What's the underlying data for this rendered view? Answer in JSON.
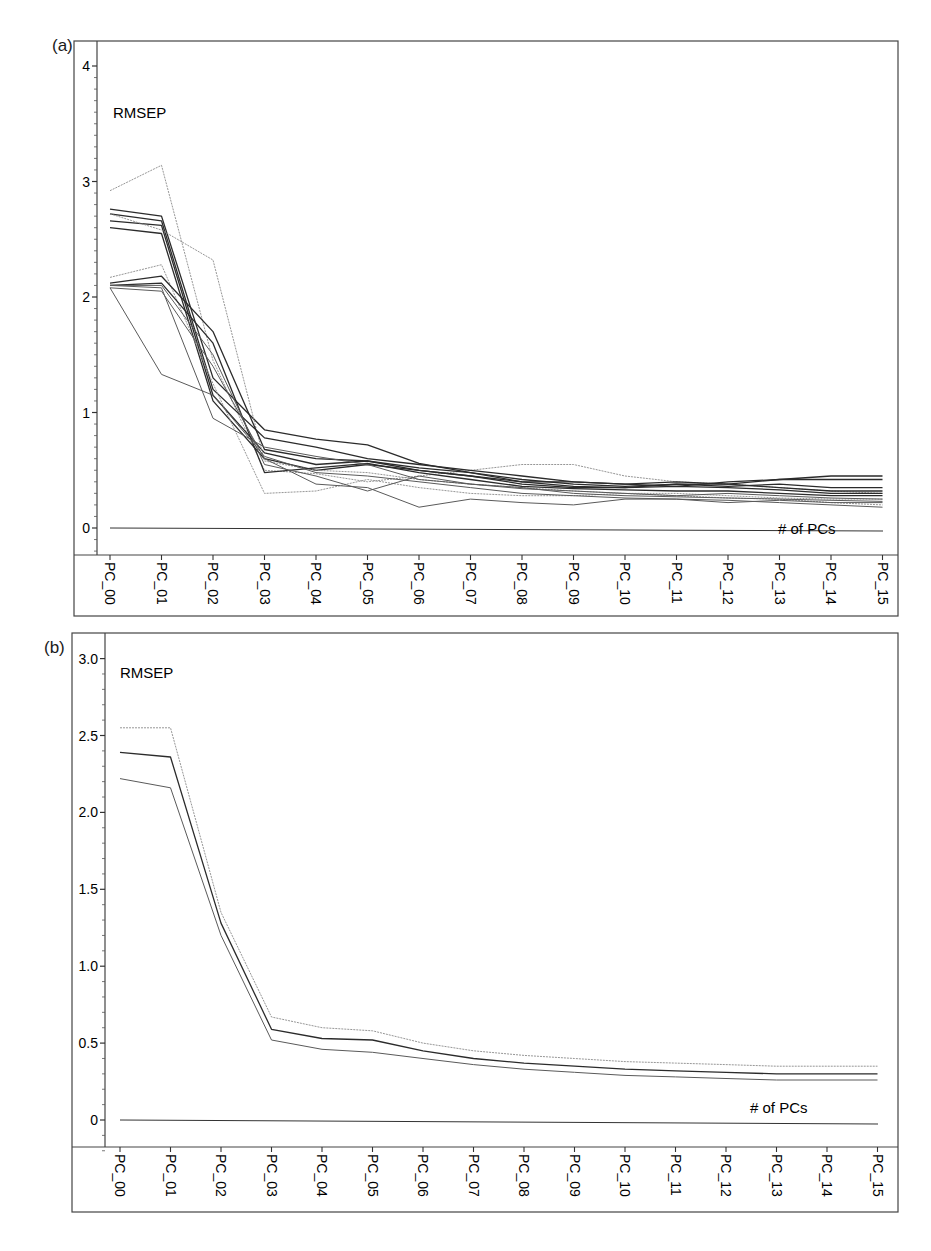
{
  "figure": {
    "panels": [
      {
        "label": "(a)",
        "ylabel": "RMSEP",
        "xlabel": "# of PCs"
      },
      {
        "label": "(b)",
        "ylabel": "RMSEP",
        "xlabel": "# of PCs"
      }
    ]
  },
  "chart_data": [
    {
      "type": "line",
      "panel": "(a)",
      "title": "",
      "ylabel": "RMSEP",
      "xlabel": "# of PCs",
      "ylim": [
        -0.2,
        4.2
      ],
      "yticks": [
        0,
        1,
        2,
        3,
        4
      ],
      "grid": false,
      "legend": "none",
      "categories": [
        "PC_00",
        "PC_01",
        "PC_02",
        "PC_03",
        "PC_04",
        "PC_05",
        "PC_06",
        "PC_07",
        "PC_08",
        "PC_09",
        "PC_10",
        "PC_11",
        "PC_12",
        "PC_13",
        "PC_14",
        "PC_15"
      ],
      "series": [
        {
          "name": "s1",
          "style": "light",
          "values": [
            2.92,
            3.14,
            1.45,
            0.5,
            0.47,
            0.4,
            0.45,
            0.5,
            0.55,
            0.55,
            0.45,
            0.4,
            0.38,
            0.35,
            0.32,
            0.3
          ]
        },
        {
          "name": "s2",
          "style": "dark",
          "values": [
            2.76,
            2.7,
            1.3,
            0.85,
            0.77,
            0.72,
            0.56,
            0.48,
            0.4,
            0.4,
            0.38,
            0.4,
            0.38,
            0.42,
            0.45,
            0.45
          ]
        },
        {
          "name": "s3",
          "style": "dark",
          "values": [
            2.72,
            2.66,
            1.2,
            0.78,
            0.7,
            0.6,
            0.55,
            0.5,
            0.45,
            0.4,
            0.38,
            0.36,
            0.4,
            0.42,
            0.42,
            0.42
          ]
        },
        {
          "name": "s4",
          "style": "dark",
          "values": [
            2.66,
            2.62,
            1.15,
            0.65,
            0.55,
            0.58,
            0.52,
            0.48,
            0.42,
            0.38,
            0.36,
            0.38,
            0.36,
            0.38,
            0.35,
            0.35
          ]
        },
        {
          "name": "s5",
          "style": "dark",
          "values": [
            2.6,
            2.55,
            1.1,
            0.6,
            0.5,
            0.55,
            0.5,
            0.45,
            0.4,
            0.36,
            0.35,
            0.36,
            0.35,
            0.33,
            0.3,
            0.3
          ]
        },
        {
          "name": "s6",
          "style": "light",
          "values": [
            2.72,
            2.58,
            2.32,
            0.58,
            0.5,
            0.48,
            0.42,
            0.38,
            0.35,
            0.32,
            0.3,
            0.3,
            0.28,
            0.26,
            0.25,
            0.25
          ]
        },
        {
          "name": "s7",
          "style": "light",
          "values": [
            2.17,
            2.28,
            1.25,
            0.3,
            0.32,
            0.42,
            0.35,
            0.3,
            0.28,
            0.28,
            0.3,
            0.28,
            0.26,
            0.25,
            0.22,
            0.2
          ]
        },
        {
          "name": "s8",
          "style": "dark",
          "values": [
            2.12,
            2.18,
            1.7,
            0.68,
            0.6,
            0.58,
            0.5,
            0.45,
            0.38,
            0.35,
            0.35,
            0.38,
            0.38,
            0.35,
            0.32,
            0.32
          ]
        },
        {
          "name": "s9",
          "style": "dark",
          "values": [
            2.1,
            2.12,
            1.6,
            0.48,
            0.52,
            0.56,
            0.48,
            0.42,
            0.36,
            0.34,
            0.33,
            0.32,
            0.32,
            0.3,
            0.28,
            0.28
          ]
        },
        {
          "name": "s10",
          "style": "mid",
          "values": [
            2.1,
            2.1,
            1.5,
            0.55,
            0.45,
            0.32,
            0.45,
            0.38,
            0.34,
            0.32,
            0.3,
            0.28,
            0.3,
            0.28,
            0.26,
            0.25
          ]
        },
        {
          "name": "s11",
          "style": "mid",
          "values": [
            2.08,
            2.05,
            1.4,
            0.6,
            0.38,
            0.35,
            0.18,
            0.25,
            0.22,
            0.2,
            0.25,
            0.25,
            0.22,
            0.24,
            0.22,
            0.22
          ]
        },
        {
          "name": "s12",
          "style": "mid",
          "values": [
            2.08,
            1.33,
            1.15,
            0.62,
            0.48,
            0.45,
            0.4,
            0.35,
            0.3,
            0.28,
            0.26,
            0.25,
            0.24,
            0.22,
            0.2,
            0.18
          ]
        },
        {
          "name": "s13",
          "style": "mid",
          "values": [
            2.1,
            2.08,
            0.95,
            0.7,
            0.62,
            0.55,
            0.42,
            0.38,
            0.35,
            0.3,
            0.28,
            0.27,
            0.26,
            0.25,
            0.24,
            0.23
          ]
        },
        {
          "name": "baseline",
          "style": "axis",
          "values": [
            0,
            0,
            0,
            0,
            0,
            0,
            0,
            0,
            0,
            0,
            0,
            0,
            0,
            0,
            0,
            0
          ]
        }
      ]
    },
    {
      "type": "line",
      "panel": "(b)",
      "title": "",
      "ylabel": "RMSEP",
      "xlabel": "# of PCs",
      "ylim": [
        -0.2,
        3.1
      ],
      "yticks": [
        0,
        0.5,
        1.0,
        1.5,
        2.0,
        2.5,
        3.0
      ],
      "ytick_labels": [
        "0",
        "0.5",
        "1.0",
        "1.5",
        "2.0",
        "2.5",
        "3.0"
      ],
      "grid": false,
      "legend": "none",
      "categories": [
        "PC_00",
        "PC_01",
        "PC_02",
        "PC_03",
        "PC_04",
        "PC_05",
        "PC_06",
        "PC_07",
        "PC_08",
        "PC_09",
        "PC_10",
        "PC_11",
        "PC_12",
        "PC_13",
        "PC_14",
        "PC_15"
      ],
      "series": [
        {
          "name": "upper",
          "style": "light",
          "values": [
            2.55,
            2.55,
            1.35,
            0.67,
            0.6,
            0.58,
            0.5,
            0.45,
            0.42,
            0.4,
            0.38,
            0.37,
            0.36,
            0.35,
            0.35,
            0.35
          ]
        },
        {
          "name": "mean",
          "style": "dark",
          "values": [
            2.39,
            2.36,
            1.28,
            0.59,
            0.53,
            0.52,
            0.45,
            0.4,
            0.37,
            0.35,
            0.33,
            0.32,
            0.31,
            0.3,
            0.3,
            0.3
          ]
        },
        {
          "name": "lower",
          "style": "mid",
          "values": [
            2.22,
            2.16,
            1.2,
            0.52,
            0.46,
            0.44,
            0.4,
            0.36,
            0.33,
            0.31,
            0.29,
            0.28,
            0.27,
            0.26,
            0.26,
            0.26
          ]
        },
        {
          "name": "baseline",
          "style": "axis",
          "values": [
            0,
            0,
            0,
            0,
            0,
            0,
            0,
            0,
            0,
            0,
            0,
            0,
            0,
            0,
            0,
            0
          ]
        }
      ]
    }
  ]
}
